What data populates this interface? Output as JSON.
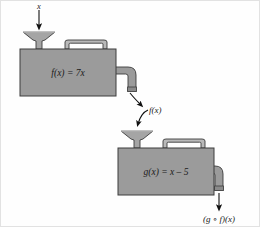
{
  "figure": {
    "background_color": "#fefefe",
    "frame_color": "#e2e2e2"
  },
  "colors": {
    "machine_fill": "#9b9b9b",
    "machine_stroke": "#3c3c3c",
    "pipe_fill": "#9b9b9b",
    "pipe_stroke": "#3c3c3c",
    "handle_fill": "#b9b9b9",
    "handle_stroke": "#3c3c3c",
    "funnel_fill": "#a5a5a5",
    "funnel_stroke": "#3c3c3c",
    "arrow_color": "#111111",
    "text_color": "#1a1a1a"
  },
  "labels": {
    "input": "x",
    "machine_one": "f(x) = 7x",
    "intermediate": "f(x)",
    "machine_two": "g(x) = x – 5",
    "output": "(g ∘ f)(x)"
  },
  "machines": [
    {
      "id": "machine-f",
      "expression": "f(x) = 7x",
      "box": {
        "x": 19,
        "y": 48,
        "width": 96,
        "height": 47
      },
      "funnel": {
        "cx": 38,
        "top_y": 29
      },
      "handle": {
        "x": 64,
        "y": 39,
        "width": 42,
        "height": 9
      },
      "spout": {
        "x": 115,
        "y": 72
      }
    },
    {
      "id": "machine-g",
      "expression": "g(x) = x – 5",
      "box": {
        "x": 117,
        "y": 147,
        "width": 96,
        "height": 47
      },
      "funnel": {
        "cx": 136,
        "top_y": 128
      },
      "handle": {
        "x": 162,
        "y": 138,
        "width": 42,
        "height": 9
      },
      "spout": {
        "x": 213,
        "y": 171
      }
    }
  ],
  "flows": [
    {
      "id": "input-flow",
      "label": "x",
      "type": "straight-arrow",
      "from": [
        38,
        8
      ],
      "to": [
        38,
        27
      ]
    },
    {
      "id": "intermediate-flow-out",
      "label": "f(x)",
      "type": "curved-arrow",
      "from": [
        129,
        90
      ],
      "to": [
        141,
        105
      ]
    },
    {
      "id": "intermediate-flow-in",
      "label": "f(x)",
      "type": "curved-arrow",
      "from": [
        143,
        108
      ],
      "to": [
        136,
        125
      ]
    },
    {
      "id": "output-flow",
      "label": "(g ∘ f)(x)",
      "type": "straight-arrow",
      "from": [
        221,
        190
      ],
      "to": [
        221,
        208
      ]
    }
  ]
}
